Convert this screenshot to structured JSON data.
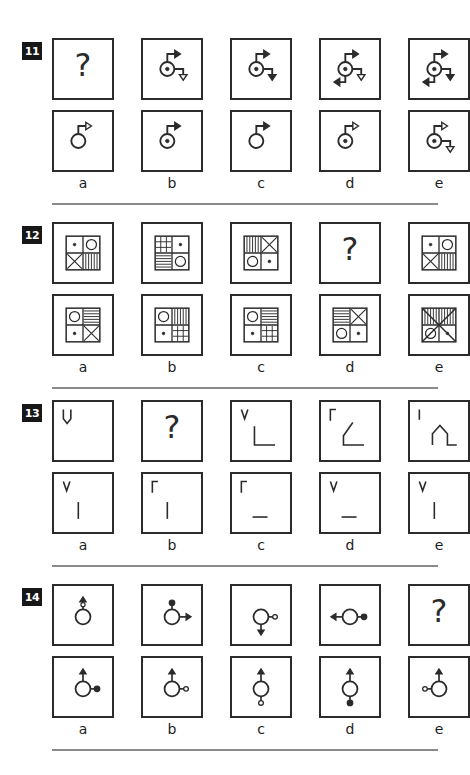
{
  "page": {
    "background": "#ffffff",
    "ink": "#2b2b2b",
    "badge_bg": "#171717",
    "badge_fg": "#ffffff",
    "divider_color": "#8a8a8a"
  },
  "option_labels": [
    "a",
    "b",
    "c",
    "d",
    "e"
  ],
  "questions": [
    {
      "number": "11",
      "theme": "circle-with-arrows",
      "problem_row": [
        {
          "type": "question-mark",
          "description": "question mark placeholder"
        },
        {
          "type": "arrow-hub",
          "hub": "dotted-circle",
          "arrows": [
            "up-right-solid",
            "right-down-open"
          ]
        },
        {
          "type": "arrow-hub",
          "hub": "dotted-circle",
          "arrows": [
            "up-right-solid",
            "right-down-solid"
          ]
        },
        {
          "type": "arrow-hub",
          "hub": "dotted-circle",
          "arrows": [
            "up-right-solid",
            "right-down-open",
            "down-left-solid"
          ]
        },
        {
          "type": "arrow-hub",
          "hub": "dotted-circle",
          "arrows": [
            "up-right-solid",
            "right-down-solid",
            "down-left-solid"
          ]
        }
      ],
      "options": [
        {
          "label": "a",
          "type": "arrow-hub",
          "hub": "plain-circle",
          "arrows": [
            "up-right-open"
          ]
        },
        {
          "label": "b",
          "type": "arrow-hub",
          "hub": "dotted-circle",
          "arrows": [
            "up-right-solid"
          ]
        },
        {
          "label": "c",
          "type": "arrow-hub",
          "hub": "plain-circle",
          "arrows": [
            "up-right-solid"
          ]
        },
        {
          "label": "d",
          "type": "arrow-hub",
          "hub": "dotted-circle",
          "arrows": [
            "up-right-open"
          ]
        },
        {
          "label": "e",
          "type": "arrow-hub",
          "hub": "dotted-circle",
          "arrows": [
            "up-right-open",
            "right-down-open"
          ]
        }
      ]
    },
    {
      "number": "12",
      "theme": "four-quadrant-pattern-tiles",
      "problem_row": [
        {
          "type": "quad-tile",
          "quadrants": [
            "dot",
            "circle",
            "cross",
            "vertical-stripes"
          ]
        },
        {
          "type": "quad-tile",
          "quadrants": [
            "grid",
            "dot",
            "horizontal-stripes",
            "circle"
          ]
        },
        {
          "type": "quad-tile",
          "quadrants": [
            "vertical-stripes",
            "cross",
            "circle",
            "dot"
          ]
        },
        {
          "type": "question-mark",
          "description": "question mark placeholder"
        },
        {
          "type": "quad-tile",
          "quadrants": [
            "dot",
            "circle",
            "cross",
            "vertical-stripes"
          ]
        }
      ],
      "options": [
        {
          "label": "a",
          "type": "quad-tile",
          "quadrants": [
            "circle",
            "horizontal-stripes",
            "dot",
            "cross"
          ]
        },
        {
          "label": "b",
          "type": "quad-tile",
          "quadrants": [
            "circle",
            "vertical-stripes",
            "dot",
            "grid"
          ]
        },
        {
          "label": "c",
          "type": "quad-tile",
          "quadrants": [
            "circle",
            "horizontal-stripes",
            "dot",
            "grid"
          ]
        },
        {
          "label": "d",
          "type": "quad-tile",
          "quadrants": [
            "horizontal-stripes",
            "cross",
            "circle",
            "dot"
          ]
        },
        {
          "label": "e",
          "type": "quad-tile-overlay",
          "quadrants": [
            "vertical-stripes",
            "vertical-stripes",
            "circle",
            "dot"
          ],
          "overlay": "big-cross"
        }
      ]
    },
    {
      "number": "13",
      "theme": "line-strokes",
      "problem_row": [
        {
          "type": "stroke",
          "strokes": [
            "tall-narrow-u-top-left"
          ]
        },
        {
          "type": "question-mark",
          "description": "question mark placeholder"
        },
        {
          "type": "stroke",
          "strokes": [
            "small-v-top-left",
            "large-L"
          ]
        },
        {
          "type": "stroke",
          "strokes": [
            "small-hook-top-left",
            "large-checkmark-L"
          ]
        },
        {
          "type": "stroke",
          "strokes": [
            "small-tick-top-left",
            "peaked-roof-L"
          ]
        }
      ],
      "options": [
        {
          "label": "a",
          "type": "stroke",
          "strokes": [
            "v-top-left",
            "vertical-bar-long"
          ]
        },
        {
          "label": "b",
          "type": "stroke",
          "strokes": [
            "hook-top-left",
            "vertical-bar-long"
          ]
        },
        {
          "label": "c",
          "type": "stroke",
          "strokes": [
            "hook-top-left",
            "short-underline"
          ]
        },
        {
          "label": "d",
          "type": "stroke",
          "strokes": [
            "v-top-left",
            "short-underline"
          ]
        },
        {
          "label": "e",
          "type": "stroke",
          "strokes": [
            "v-top-left",
            "vertical-bar-long"
          ]
        }
      ]
    },
    {
      "number": "14",
      "theme": "circle-with-node-and-arrow",
      "problem_row": [
        {
          "type": "node-circle",
          "arrow": "up-arrow-with-open-dot",
          "node": "none",
          "node_side": "none"
        },
        {
          "type": "node-circle",
          "arrow": "right-arrow",
          "node": "filled-dot",
          "node_side": "top"
        },
        {
          "type": "node-circle",
          "arrow": "down-arrow",
          "node": "open-dot",
          "node_side": "right"
        },
        {
          "type": "node-circle",
          "arrow": "left-arrow",
          "node": "filled-dot",
          "node_side": "right"
        },
        {
          "type": "question-mark",
          "description": "question mark placeholder"
        }
      ],
      "options": [
        {
          "label": "a",
          "type": "node-circle",
          "arrow": "up-arrow",
          "node": "filled-dot",
          "node_side": "right"
        },
        {
          "label": "b",
          "type": "node-circle",
          "arrow": "up-arrow",
          "node": "open-dot",
          "node_side": "right"
        },
        {
          "label": "c",
          "type": "node-circle",
          "arrow": "up-arrow",
          "node": "open-dot",
          "node_side": "bottom"
        },
        {
          "label": "d",
          "type": "node-circle",
          "arrow": "up-arrow",
          "node": "filled-dot",
          "node_side": "bottom"
        },
        {
          "label": "e",
          "type": "node-circle",
          "arrow": "up-arrow",
          "node": "open-dot",
          "node_side": "left"
        }
      ]
    }
  ]
}
